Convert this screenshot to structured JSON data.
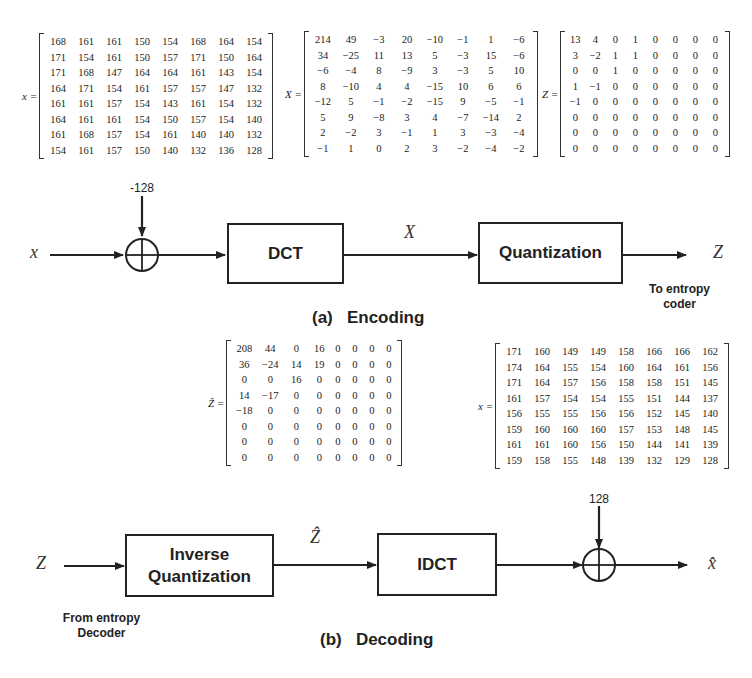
{
  "encoding": {
    "caption": "(a)   Encoding",
    "input_symbol": "x",
    "offset_label": "-128",
    "dct_block": "DCT",
    "intermediate_symbol": "X",
    "quant_block": "Quantization",
    "output_symbol": "Z",
    "output_note_line1": "To entropy",
    "output_note_line2": "coder",
    "matrix_x": {
      "label": "x =",
      "rows": [
        [
          168,
          161,
          161,
          150,
          154,
          168,
          164,
          154
        ],
        [
          171,
          154,
          161,
          150,
          157,
          171,
          150,
          164
        ],
        [
          171,
          168,
          147,
          164,
          164,
          161,
          143,
          154
        ],
        [
          164,
          171,
          154,
          161,
          157,
          157,
          147,
          132
        ],
        [
          161,
          161,
          157,
          154,
          143,
          161,
          154,
          132
        ],
        [
          164,
          161,
          161,
          154,
          150,
          157,
          154,
          140
        ],
        [
          161,
          168,
          157,
          154,
          161,
          140,
          140,
          132
        ],
        [
          154,
          161,
          157,
          150,
          140,
          132,
          136,
          128
        ]
      ]
    },
    "matrix_X": {
      "label": "X =",
      "rows": [
        [
          "214",
          "49",
          "−3",
          "20",
          "−10",
          "−1",
          "1",
          "−6"
        ],
        [
          "34",
          "−25",
          "11",
          "13",
          "5",
          "−3",
          "15",
          "−6"
        ],
        [
          "−6",
          "−4",
          "8",
          "−9",
          "3",
          "−3",
          "5",
          "10"
        ],
        [
          "8",
          "−10",
          "4",
          "4",
          "−15",
          "10",
          "6",
          "6"
        ],
        [
          "−12",
          "5",
          "−1",
          "−2",
          "−15",
          "9",
          "−5",
          "−1"
        ],
        [
          "5",
          "9",
          "−8",
          "3",
          "4",
          "−7",
          "−14",
          "2"
        ],
        [
          "2",
          "−2",
          "3",
          "−1",
          "1",
          "3",
          "−3",
          "−4"
        ],
        [
          "−1",
          "1",
          "0",
          "2",
          "3",
          "−2",
          "−4",
          "−2"
        ]
      ]
    },
    "matrix_Z": {
      "label": "Z =",
      "rows": [
        [
          "13",
          "4",
          "0",
          "1",
          "0",
          "0",
          "0",
          "0"
        ],
        [
          "3",
          "−2",
          "1",
          "1",
          "0",
          "0",
          "0",
          "0"
        ],
        [
          "0",
          "0",
          "1",
          "0",
          "0",
          "0",
          "0",
          "0"
        ],
        [
          "1",
          "−1",
          "0",
          "0",
          "0",
          "0",
          "0",
          "0"
        ],
        [
          "−1",
          "0",
          "0",
          "0",
          "0",
          "0",
          "0",
          "0"
        ],
        [
          "0",
          "0",
          "0",
          "0",
          "0",
          "0",
          "0",
          "0"
        ],
        [
          "0",
          "0",
          "0",
          "0",
          "0",
          "0",
          "0",
          "0"
        ],
        [
          "0",
          "0",
          "0",
          "0",
          "0",
          "0",
          "0",
          "0"
        ]
      ]
    }
  },
  "decoding": {
    "caption": "(b)   Decoding",
    "input_symbol": "Z",
    "input_note_line1": "From entropy",
    "input_note_line2": "Decoder",
    "iquant_block_line1": "Inverse",
    "iquant_block_line2": "Quantization",
    "intermediate_symbol": "Ẑ",
    "idct_block": "IDCT",
    "offset_label": "128",
    "output_symbol": "x̂",
    "matrix_Zhat": {
      "label": "Ẑ =",
      "rows": [
        [
          "208",
          "44",
          "0",
          "16",
          "0",
          "0",
          "0",
          "0"
        ],
        [
          "36",
          "−24",
          "14",
          "19",
          "0",
          "0",
          "0",
          "0"
        ],
        [
          "0",
          "0",
          "16",
          "0",
          "0",
          "0",
          "0",
          "0"
        ],
        [
          "14",
          "−17",
          "0",
          "0",
          "0",
          "0",
          "0",
          "0"
        ],
        [
          "−18",
          "0",
          "0",
          "0",
          "0",
          "0",
          "0",
          "0"
        ],
        [
          "0",
          "0",
          "0",
          "0",
          "0",
          "0",
          "0",
          "0"
        ],
        [
          "0",
          "0",
          "0",
          "0",
          "0",
          "0",
          "0",
          "0"
        ],
        [
          "0",
          "0",
          "0",
          "0",
          "0",
          "0",
          "0",
          "0"
        ]
      ]
    },
    "matrix_xhat": {
      "label": "x =",
      "rows": [
        [
          171,
          160,
          149,
          149,
          158,
          166,
          166,
          162
        ],
        [
          174,
          164,
          155,
          154,
          160,
          164,
          161,
          156
        ],
        [
          171,
          164,
          157,
          156,
          158,
          158,
          151,
          145
        ],
        [
          161,
          157,
          154,
          154,
          155,
          151,
          144,
          137
        ],
        [
          156,
          155,
          155,
          156,
          156,
          152,
          145,
          140
        ],
        [
          159,
          160,
          160,
          160,
          157,
          153,
          148,
          145
        ],
        [
          161,
          161,
          160,
          156,
          150,
          144,
          141,
          139
        ],
        [
          159,
          158,
          155,
          148,
          139,
          132,
          129,
          128
        ]
      ]
    }
  }
}
